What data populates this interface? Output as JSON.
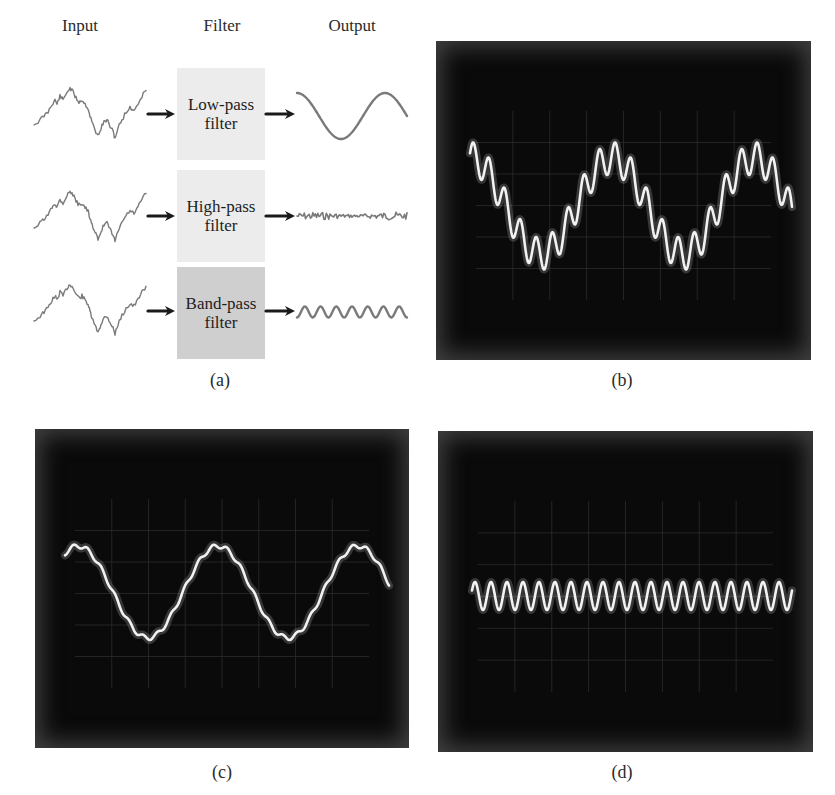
{
  "panel_a": {
    "headers": {
      "input": "Input",
      "filter": "Filter",
      "output": "Output"
    },
    "rows": [
      {
        "filter_line1": "Low-pass",
        "filter_line2": "filter",
        "box_color": "#ececec",
        "output_type": "low-pass-sine"
      },
      {
        "filter_line1": "High-pass",
        "filter_line2": "filter",
        "box_color": "#ececec",
        "output_type": "high-frequency-noise"
      },
      {
        "filter_line1": "Band-pass",
        "filter_line2": "filter",
        "box_color": "#cfcfcf",
        "output_type": "mid-frequency-sine"
      }
    ],
    "waveform_color": "#7a7a7a",
    "arrow_color": "#1a1a1a",
    "caption": "(a)"
  },
  "panel_b": {
    "caption": "(b)",
    "description": "Oscilloscope: low-frequency sine with superimposed high-frequency ripple (input)"
  },
  "panel_c": {
    "caption": "(c)",
    "description": "Oscilloscope: low-pass filtered output, smooth sine"
  },
  "panel_d": {
    "caption": "(d)",
    "description": "Oscilloscope: high-pass filtered output, high-frequency sine"
  },
  "trace_color": "#f2f2f2",
  "chart_data": [
    {
      "type": "line",
      "title": "(b) Input signal",
      "series": [
        {
          "name": "input",
          "components": [
            {
              "cycles": 2.25,
              "amplitude": 1.0
            },
            {
              "cycles": 20,
              "amplitude": 0.28
            }
          ]
        }
      ],
      "xlabel": "",
      "ylabel": "",
      "grid": true
    },
    {
      "type": "line",
      "title": "(c) Low-pass output",
      "series": [
        {
          "name": "low-pass",
          "components": [
            {
              "cycles": 2.3,
              "amplitude": 1.0
            }
          ]
        }
      ],
      "xlabel": "",
      "ylabel": "",
      "grid": true
    },
    {
      "type": "line",
      "title": "(d) High-pass output",
      "series": [
        {
          "name": "high-pass",
          "components": [
            {
              "cycles": 20,
              "amplitude": 1.0
            }
          ]
        }
      ],
      "xlabel": "",
      "ylabel": "",
      "grid": true
    }
  ]
}
